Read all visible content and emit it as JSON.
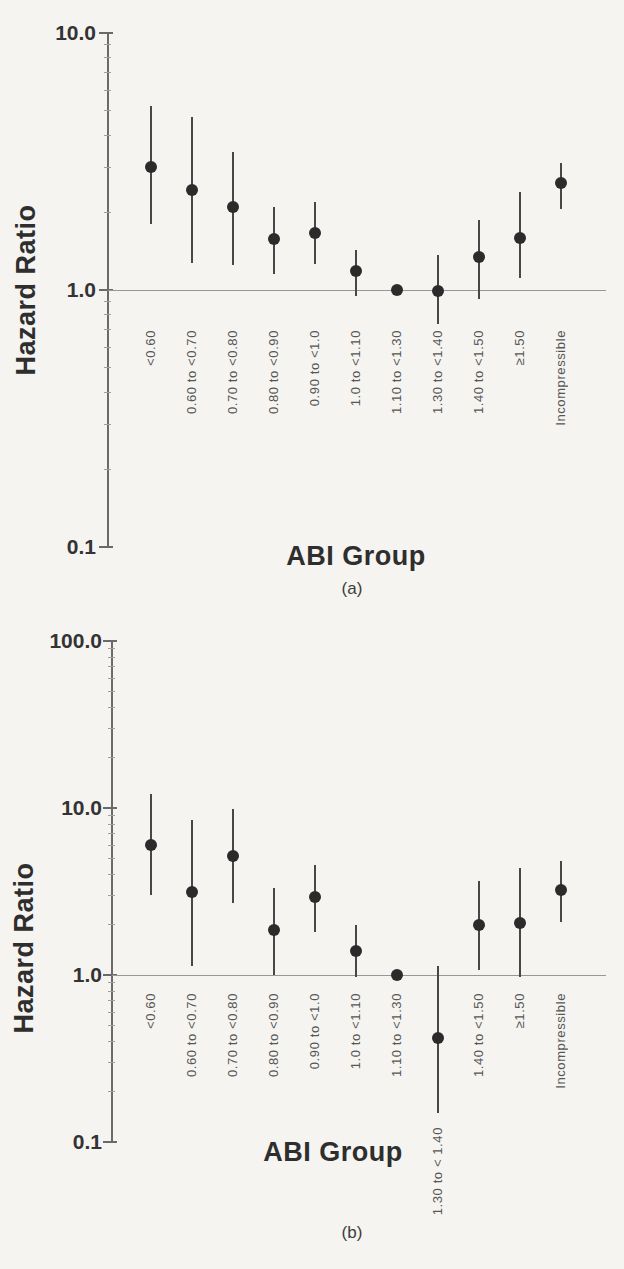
{
  "page": {
    "background": "#f5f4f0",
    "ink_color": "#2b2b2b",
    "axis_color": "#6a6a6a",
    "label_color": "#565656"
  },
  "chart_data": [
    {
      "id": "a",
      "type": "scatter",
      "caption": "(a)",
      "xlabel": "ABI Group",
      "ylabel": "Hazard Ratio",
      "y_scale": "log",
      "ylim": [
        0.1,
        10
      ],
      "grid": false,
      "reference_line": 1.0,
      "yticks": [
        {
          "value": 10,
          "label": "10.0"
        },
        {
          "value": 1,
          "label": "1.0"
        },
        {
          "value": 0.1,
          "label": "0.1"
        }
      ],
      "categories": [
        "<0.60",
        "0.60 to <0.70",
        "0.70 to <0.80",
        "0.80 to <0.90",
        "0.90 to <1.0",
        "1.0 to <1.10",
        "1.10 to <1.30",
        "1.30 to <1.40",
        "1.40 to <1.50",
        "≥1.50",
        "Incompressible"
      ],
      "series": [
        {
          "name": "Hazard Ratio (95% CI)",
          "points": [
            {
              "category": "<0.60",
              "hr": 3.0,
              "ci_low": 1.8,
              "ci_high": 5.2
            },
            {
              "category": "0.60 to <0.70",
              "hr": 2.45,
              "ci_low": 1.27,
              "ci_high": 4.7
            },
            {
              "category": "0.70 to <0.80",
              "hr": 2.1,
              "ci_low": 1.25,
              "ci_high": 3.45
            },
            {
              "category": "0.80 to <0.90",
              "hr": 1.58,
              "ci_low": 1.15,
              "ci_high": 2.1
            },
            {
              "category": "0.90 to <1.0",
              "hr": 1.67,
              "ci_low": 1.26,
              "ci_high": 2.2
            },
            {
              "category": "1.0 to <1.10",
              "hr": 1.19,
              "ci_low": 0.95,
              "ci_high": 1.43
            },
            {
              "category": "1.10 to <1.30",
              "hr": 1.0,
              "ci_low": null,
              "ci_high": null
            },
            {
              "category": "1.30 to <1.40",
              "hr": 0.99,
              "ci_low": 0.74,
              "ci_high": 1.37
            },
            {
              "category": "1.40 to <1.50",
              "hr": 1.34,
              "ci_low": 0.92,
              "ci_high": 1.87
            },
            {
              "category": "≥1.50",
              "hr": 1.6,
              "ci_low": 1.11,
              "ci_high": 2.4
            },
            {
              "category": "Incompressible",
              "hr": 2.6,
              "ci_low": 2.07,
              "ci_high": 3.12
            }
          ]
        }
      ]
    },
    {
      "id": "b",
      "type": "scatter",
      "caption": "(b)",
      "xlabel": "ABI Group",
      "ylabel": "Hazard Ratio",
      "y_scale": "log",
      "ylim": [
        0.1,
        100
      ],
      "grid": false,
      "reference_line": 1.0,
      "yticks": [
        {
          "value": 100,
          "label": "100.0"
        },
        {
          "value": 10,
          "label": "10.0"
        },
        {
          "value": 1,
          "label": "1.0"
        },
        {
          "value": 0.1,
          "label": "0.1"
        }
      ],
      "categories": [
        "<0.60",
        "0.60 to <0.70",
        "0.70 to <0.80",
        "0.80 to <0.90",
        "0.90 to <1.0",
        "1.0 to <1.10",
        "1.10 to <1.30",
        "1.30 to < 1.40",
        "1.40 to <1.50",
        "≥1.50",
        "Incompressible"
      ],
      "series": [
        {
          "name": "Hazard Ratio (95% CI)",
          "points": [
            {
              "category": "<0.60",
              "hr": 6.0,
              "ci_low": 3.0,
              "ci_high": 12.2
            },
            {
              "category": "0.60 to <0.70",
              "hr": 3.15,
              "ci_low": 1.13,
              "ci_high": 8.5
            },
            {
              "category": "0.70 to <0.80",
              "hr": 5.15,
              "ci_low": 2.7,
              "ci_high": 9.9
            },
            {
              "category": "0.80 to <0.90",
              "hr": 1.85,
              "ci_low": 1.0,
              "ci_high": 3.3
            },
            {
              "category": "0.90 to <1.0",
              "hr": 2.95,
              "ci_low": 1.8,
              "ci_high": 4.55
            },
            {
              "category": "1.0 to <1.10",
              "hr": 1.4,
              "ci_low": 0.97,
              "ci_high": 2.0
            },
            {
              "category": "1.10 to <1.30",
              "hr": 1.0,
              "ci_low": null,
              "ci_high": null
            },
            {
              "category": "1.30 to < 1.40",
              "hr": 0.42,
              "ci_low": 0.15,
              "ci_high": 1.13
            },
            {
              "category": "1.40 to <1.50",
              "hr": 2.0,
              "ci_low": 1.07,
              "ci_high": 3.65
            },
            {
              "category": "≥1.50",
              "hr": 2.05,
              "ci_low": 0.97,
              "ci_high": 4.4
            },
            {
              "category": "Incompressible",
              "hr": 3.25,
              "ci_low": 2.08,
              "ci_high": 4.8
            }
          ]
        }
      ]
    }
  ]
}
